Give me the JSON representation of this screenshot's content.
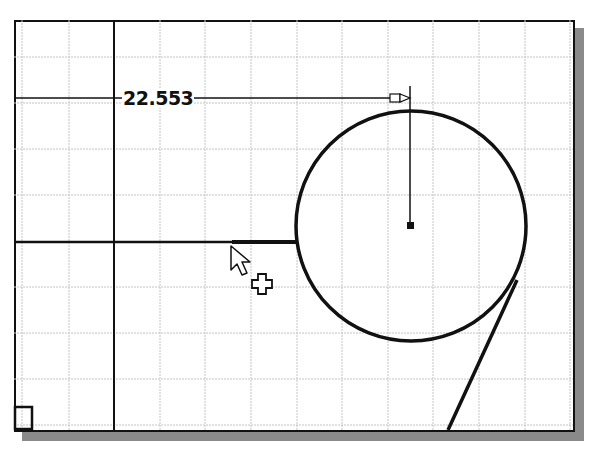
{
  "sketch": {
    "dimension_value": "22.553",
    "colors": {
      "grid": "#c4c4c4",
      "geometry": "#111111",
      "background": "#ffffff",
      "shadow": "#8a8a8a"
    },
    "circle": {
      "cx": 411,
      "cy": 226,
      "r": 115
    },
    "cursor": {
      "type": "arrow-with-plus",
      "x": 231,
      "y": 246
    }
  }
}
